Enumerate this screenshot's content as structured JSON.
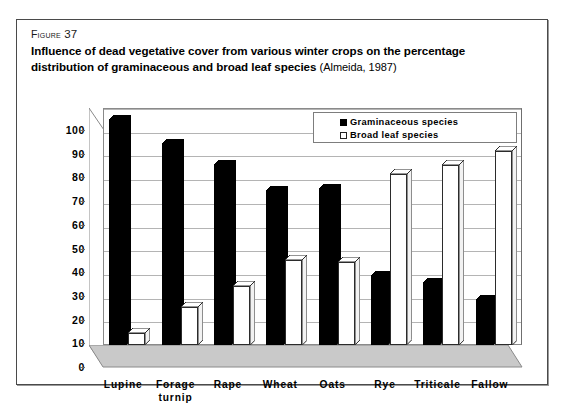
{
  "figure": {
    "number_prefix": "Figure",
    "number": "37",
    "caption": "Influence of dead vegetative cover from various winter crops on the percentage distribution of graminaceous and broad leaf species",
    "source": "(Almeida, 1987)"
  },
  "legend": {
    "position": "top-center-inside",
    "entries": [
      {
        "label": "Graminaceous species",
        "swatch": "dark"
      },
      {
        "label": "Broad leaf species",
        "swatch": "light"
      }
    ]
  },
  "colors": {
    "graminaceous": "#000000",
    "broad_leaf": "#ffffff",
    "bar_outline": "#2b2b2b",
    "gridline": "#b4b4b4",
    "plot_floor": "#c9c9c9",
    "frame": "#4a4a4a"
  },
  "chart_data": {
    "type": "bar",
    "title": "Influence of dead vegetative cover from various winter crops on the percentage distribution of graminaceous and broad leaf species",
    "xlabel": "",
    "ylabel": "",
    "ylim": [
      0,
      100
    ],
    "yticks": [
      0,
      10,
      20,
      30,
      40,
      50,
      60,
      70,
      80,
      90,
      100
    ],
    "ytick_labels": [
      "0",
      "10",
      "20",
      "30",
      "40",
      "50",
      "60",
      "70",
      "80",
      "90",
      "100"
    ],
    "grid": true,
    "legend_position": "upper center",
    "categories": [
      "Lupine",
      "Forage turnip",
      "Rape",
      "Wheat",
      "Oats",
      "Rye",
      "Triticale",
      "Fallow"
    ],
    "category_lines": [
      [
        "Lupine"
      ],
      [
        "Forage",
        "turnip"
      ],
      [
        "Rape"
      ],
      [
        "Wheat"
      ],
      [
        "Oats"
      ],
      [
        "Rye"
      ],
      [
        "Triticale"
      ],
      [
        "Fallow"
      ]
    ],
    "series": [
      {
        "name": "Graminaceous species",
        "values": [
          95,
          85,
          76,
          65,
          66,
          29,
          26,
          19
        ]
      },
      {
        "name": "Broad leaf species",
        "values": [
          5,
          16,
          25,
          36,
          35,
          72,
          76,
          82
        ]
      }
    ]
  }
}
